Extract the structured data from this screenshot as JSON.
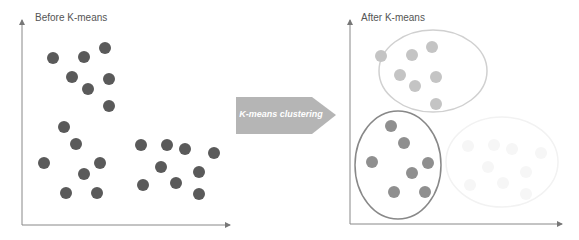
{
  "diagram": {
    "before": {
      "title": "Before K-means",
      "point_color": "#5a5a5a",
      "points": [
        [
          53,
          58
        ],
        [
          84,
          57
        ],
        [
          105,
          48
        ],
        [
          72,
          77
        ],
        [
          109,
          79
        ],
        [
          88,
          89
        ],
        [
          109,
          106
        ],
        [
          64,
          127
        ],
        [
          76,
          144
        ],
        [
          44,
          163
        ],
        [
          100,
          163
        ],
        [
          84,
          174
        ],
        [
          66,
          193
        ],
        [
          97,
          193
        ],
        [
          141,
          145
        ],
        [
          167,
          145
        ],
        [
          185,
          149
        ],
        [
          214,
          153
        ],
        [
          161,
          167
        ],
        [
          199,
          172
        ],
        [
          143,
          185
        ],
        [
          176,
          183
        ],
        [
          199,
          194
        ]
      ]
    },
    "arrow": {
      "label": "K-means clustering",
      "color": "#b5b5b5"
    },
    "after": {
      "title": "After K-means",
      "clusters": [
        {
          "name": "cluster-1",
          "point_color": "#c4c4c4",
          "ellipse_color": "#d0d0d0",
          "ellipse": {
            "cx": 433,
            "cy": 71,
            "rx": 54,
            "ry": 41
          },
          "points": [
            [
              381,
              56
            ],
            [
              412,
              55
            ],
            [
              432,
              47
            ],
            [
              400,
              75
            ],
            [
              436,
              77
            ],
            [
              415,
              86
            ],
            [
              436,
              104
            ]
          ]
        },
        {
          "name": "cluster-2",
          "point_color": "#8f8f8f",
          "ellipse_color": "#888888",
          "ellipse": {
            "cx": 398,
            "cy": 165,
            "rx": 43,
            "ry": 54
          },
          "points": [
            [
              391,
              126
            ],
            [
              404,
              143
            ],
            [
              372,
              162
            ],
            [
              428,
              163
            ],
            [
              412,
              173
            ],
            [
              394,
              192
            ],
            [
              425,
              192
            ]
          ]
        },
        {
          "name": "cluster-3",
          "point_color": "#f6f6f6",
          "ellipse_color": "#f2f2f2",
          "ellipse": {
            "cx": 502,
            "cy": 162,
            "rx": 56,
            "ry": 45
          },
          "points": [
            [
              468,
              146
            ],
            [
              494,
              145
            ],
            [
              512,
              149
            ],
            [
              541,
              153
            ],
            [
              488,
              167
            ],
            [
              526,
              172
            ],
            [
              470,
              185
            ],
            [
              503,
              183
            ],
            [
              526,
              194
            ]
          ]
        }
      ]
    }
  }
}
